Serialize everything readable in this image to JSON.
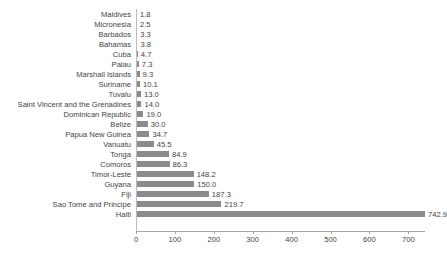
{
  "chart_data": {
    "type": "bar",
    "orientation": "horizontal",
    "title": "",
    "subtitle": "",
    "xlabel": "",
    "ylabel": "",
    "grid": false,
    "legend": false,
    "legend_position": "none",
    "bar_color": "#8b8b8b",
    "axis_color": "#a6a6a6",
    "text_color": "#3f3f3f",
    "xlim": [
      0,
      742.9
    ],
    "x_ticks": [
      0,
      100,
      200,
      300,
      400,
      500,
      600,
      700
    ],
    "x_tick_labels": [
      "0",
      "100",
      "200",
      "300",
      "400",
      "500",
      "600",
      "700"
    ],
    "categories": [
      "Maldives",
      "Micronesia",
      "Barbados",
      "Bahamas",
      "Cuba",
      "Palau",
      "Marshall Islands",
      "Suriname",
      "Tuvalu",
      "Saint Vincent and the Grenadines",
      "Dominican Republic",
      "Belize",
      "Papua New Guinea",
      "Vanuatu",
      "Tonga",
      "Comoros",
      "Timor-Leste",
      "Guyana",
      "Fiji",
      "Sao Tome and Principe",
      "Haiti"
    ],
    "values": [
      1.8,
      2.5,
      3.3,
      3.8,
      4.7,
      7.3,
      9.3,
      10.1,
      13.0,
      14.0,
      19.0,
      30.0,
      34.7,
      45.5,
      84.9,
      86.3,
      148.2,
      150.0,
      187.3,
      219.7,
      742.9
    ],
    "value_labels": [
      "1.8",
      "2.5",
      "3.3",
      "3.8",
      "4.7",
      "7.3",
      "9.3",
      "10.1",
      "13.0",
      "14.0",
      "19.0",
      "30.0",
      "34.7",
      "45.5",
      "84.9",
      "86.3",
      "148.2",
      "150.0",
      "187.3",
      "219.7",
      "742.9"
    ]
  }
}
